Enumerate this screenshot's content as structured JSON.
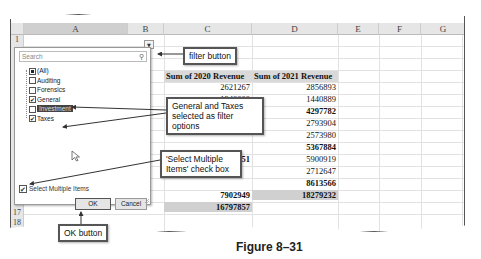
{
  "sheet": {
    "columns": [
      "A",
      "B",
      "C",
      "D",
      "E",
      "F",
      "G"
    ],
    "rows_visible": [
      "1",
      "2",
      "17",
      "18"
    ],
    "a2": "Accounting Type",
    "b2": "(All)",
    "header_c": "Sum of 2020 Revenue",
    "header_d": "Sum of 2021 Revenue",
    "c_values": [
      "2621267",
      "1340000",
      "",
      "",
      "",
      "4924551",
      "",
      "",
      "7902949"
    ],
    "c_total": "16797857",
    "d_values": [
      "2856893",
      "1440889",
      "4297782",
      "2793904",
      "2573980",
      "5367884",
      "5900919",
      "2712647",
      "8613566"
    ],
    "d_bold": [
      false,
      false,
      true,
      false,
      false,
      true,
      false,
      false,
      true
    ],
    "d_total": "18279232"
  },
  "filter_panel": {
    "search_placeholder": "Search",
    "items": [
      {
        "label": "(All)",
        "state": "partial"
      },
      {
        "label": "Auditing",
        "state": "unchecked"
      },
      {
        "label": "Forensics",
        "state": "unchecked"
      },
      {
        "label": "General",
        "state": "checked"
      },
      {
        "label": "Investment",
        "state": "unchecked",
        "highlighted": true
      },
      {
        "label": "Taxes",
        "state": "checked"
      }
    ],
    "select_multiple_label": "Select Multiple Items",
    "select_multiple_checked": true,
    "ok_label": "OK",
    "cancel_label": "Cancel",
    "check_glyph": "✔",
    "search_icon_glyph": "⚲",
    "dropdown_glyph": "▼"
  },
  "callouts": {
    "filter_button": "filter button",
    "general_taxes": "General and Taxes selected as filter options",
    "select_multiple": "'Select Multiple Items' check box",
    "ok_button": "OK button"
  },
  "caption": "Figure 8–31"
}
